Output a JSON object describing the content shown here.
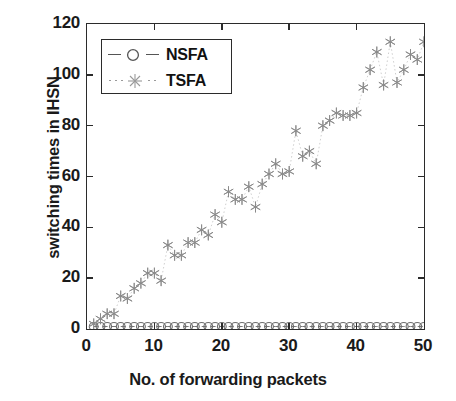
{
  "chart_data": {
    "type": "scatter",
    "title": "",
    "xlabel": "No. of forwarding packets",
    "ylabel": "switching times in IHSN",
    "xlim": [
      0,
      50
    ],
    "ylim": [
      0,
      120
    ],
    "xticks": [
      0,
      10,
      20,
      30,
      40,
      50
    ],
    "yticks": [
      0,
      20,
      40,
      60,
      80,
      100,
      120
    ],
    "grid": false,
    "legend_position": "upper left",
    "marker_color": "#8a8a8a",
    "axis_color": "#2b2b2b",
    "series": [
      {
        "name": "NSFA",
        "marker": "circle",
        "linestyle": "dashed",
        "x": [
          1,
          2,
          3,
          4,
          5,
          6,
          7,
          8,
          9,
          10,
          11,
          12,
          13,
          14,
          15,
          16,
          17,
          18,
          19,
          20,
          21,
          22,
          23,
          24,
          25,
          26,
          27,
          28,
          29,
          30,
          31,
          32,
          33,
          34,
          35,
          36,
          37,
          38,
          39,
          40,
          41,
          42,
          43,
          44,
          45,
          46,
          47,
          48,
          49,
          50
        ],
        "values": [
          1,
          1,
          1,
          1,
          1,
          1,
          1,
          1,
          1,
          1,
          1,
          1,
          1,
          1,
          1,
          1,
          1,
          1,
          1,
          1,
          1,
          1,
          1,
          1,
          1,
          1,
          1,
          1,
          1,
          1,
          1,
          1,
          1,
          1,
          1,
          1,
          1,
          1,
          1,
          1,
          1,
          1,
          1,
          1,
          1,
          1,
          1,
          1,
          1,
          1
        ]
      },
      {
        "name": "TSFA",
        "marker": "asterisk",
        "linestyle": "dotted",
        "x": [
          1,
          2,
          3,
          4,
          5,
          6,
          7,
          8,
          9,
          10,
          11,
          12,
          13,
          14,
          15,
          16,
          17,
          18,
          19,
          20,
          21,
          22,
          23,
          24,
          25,
          26,
          27,
          28,
          29,
          30,
          31,
          32,
          33,
          34,
          35,
          36,
          37,
          38,
          39,
          40,
          41,
          42,
          43,
          44,
          45,
          46,
          47,
          48,
          49,
          50
        ],
        "values": [
          2,
          4,
          6,
          6,
          13,
          12,
          16,
          18,
          22,
          22,
          19,
          33,
          29,
          29,
          34,
          34,
          39,
          37,
          45,
          42,
          54,
          51,
          51,
          56,
          48,
          57,
          61,
          65,
          61,
          62,
          78,
          68,
          70,
          65,
          80,
          82,
          85,
          84,
          84,
          85,
          95,
          102,
          109,
          96,
          113,
          97,
          102,
          108,
          106,
          113
        ]
      }
    ]
  },
  "legend": {
    "entries": [
      {
        "label": "NSFA",
        "marker": "circle-marker",
        "linestyle": "dashed"
      },
      {
        "label": "TSFA",
        "marker": "asterisk-marker",
        "linestyle": "dotted"
      }
    ]
  },
  "axes": {
    "x": {
      "label": "No. of forwarding packets",
      "tick_labels": [
        "0",
        "10",
        "20",
        "30",
        "40",
        "50"
      ]
    },
    "y": {
      "label": "switching times in IHSN",
      "tick_labels": [
        "0",
        "20",
        "40",
        "60",
        "80",
        "100",
        "120"
      ]
    }
  }
}
